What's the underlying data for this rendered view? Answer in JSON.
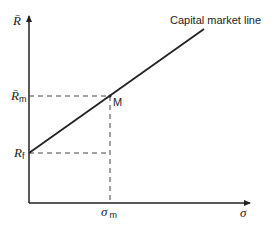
{
  "diagram": {
    "title": "Capital market line",
    "y_axis_label": "R̄",
    "x_axis_label": "σ",
    "labels": {
      "rm_main": "R̄",
      "rm_sub": "m",
      "rf_main": "R",
      "rf_sub": "f",
      "sigma_m_main": "σ",
      "sigma_m_sub": "m",
      "point_m": "M",
      "line_label": "Capital market line"
    },
    "colors": {
      "line": "#222222",
      "dashed": "#444444",
      "background": "#ffffff"
    }
  }
}
